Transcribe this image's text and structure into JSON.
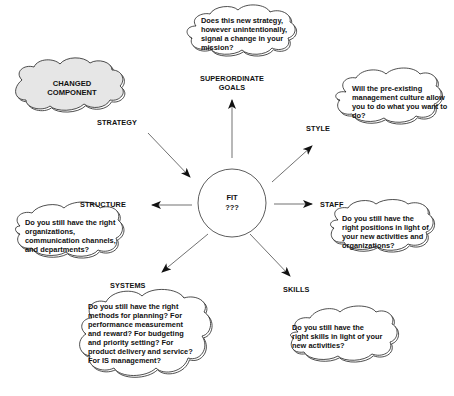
{
  "diagram": {
    "center": {
      "line1": "FIT",
      "line2": "???"
    },
    "changed_component": {
      "line1": "CHANGED",
      "line2": "COMPONENT",
      "fill": "#e6e6e6"
    },
    "labels": {
      "strategy": "STRATEGY",
      "superordinate_goals": {
        "line1": "SUPERORDINATE",
        "line2": "GOALS"
      },
      "style": "STYLE",
      "staff": "STAFF",
      "skills": "SKILLS",
      "systems": "SYSTEMS",
      "structure": "STRUCTURE"
    },
    "clouds": {
      "superordinate_goals": [
        "Does this new strategy,",
        "however unintentionally,",
        "signal a change in your",
        "mission?"
      ],
      "style": [
        "Will the pre-existing",
        "management culture allow",
        "you to do what you want to",
        "do?"
      ],
      "staff": [
        "Do you still have the",
        "right positions in light of",
        "your new activities and",
        "organizations?"
      ],
      "skills": [
        "Do you still have the",
        "right skills in light of your",
        "new activities?"
      ],
      "systems": [
        "Do you still have the right",
        "methods for planning? For",
        "performance measurement",
        "and reward? For budgeting",
        "and priority setting? For",
        "product delivery and service?",
        "For IS management?"
      ],
      "structure": [
        "Do you still have the right",
        "organizations,",
        "communication channels,",
        "and departments?"
      ]
    },
    "colors": {
      "line": "#222222",
      "cloud_fill": "#ffffff",
      "changed_fill": "#e6e6e6"
    }
  }
}
